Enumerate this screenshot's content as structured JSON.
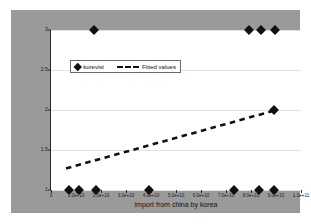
{
  "chart_data": {
    "type": "scatter",
    "title": "",
    "xlabel": "import from china by korea",
    "ylabel": "",
    "xlim": [
      0,
      100000000000
    ],
    "ylim": [
      1,
      3
    ],
    "grid": true,
    "legend_position": "upper-left-inside",
    "xticks": [
      0,
      10000000000,
      20000000000,
      30000000000,
      40000000000,
      50000000000,
      60000000000,
      70000000000,
      80000000000,
      90000000000,
      100000000000
    ],
    "xtick_labels": [
      "0",
      "1.0e+10",
      "2.0e+10",
      "3.0e+10",
      "4.0e+10",
      "5.0e+10",
      "6.0e+10",
      "7.0e+10",
      "8.0e+10",
      "9.0e+10",
      "1.0e+11"
    ],
    "yticks": [
      1,
      1.5,
      2,
      2.5,
      3
    ],
    "ytick_labels": [
      "1",
      "1.5",
      "2",
      "2.5",
      "3"
    ],
    "series": [
      {
        "name": "korevist",
        "type": "scatter",
        "marker": "diamond",
        "color": "#111111",
        "points": [
          {
            "x": 7000000000,
            "y": 1
          },
          {
            "x": 11000000000,
            "y": 1
          },
          {
            "x": 18000000000,
            "y": 1
          },
          {
            "x": 39000000000,
            "y": 1
          },
          {
            "x": 73000000000,
            "y": 1
          },
          {
            "x": 83000000000,
            "y": 1
          },
          {
            "x": 89000000000,
            "y": 1
          },
          {
            "x": 17000000000,
            "y": 3
          },
          {
            "x": 79000000000,
            "y": 3
          },
          {
            "x": 84000000000,
            "y": 3
          },
          {
            "x": 89500000000,
            "y": 3
          },
          {
            "x": 89000000000,
            "y": 2
          }
        ]
      },
      {
        "name": "Fitted values",
        "type": "line",
        "style": "dashed",
        "color": "#111111",
        "points": [
          {
            "x": 6000000000,
            "y": 1.27
          },
          {
            "x": 89000000000,
            "y": 1.99
          }
        ]
      }
    ]
  },
  "legend": {
    "entries": [
      {
        "label": "korevist",
        "icon": "diamond-marker"
      },
      {
        "label": "Fitted values",
        "icon": "dashed-line"
      }
    ]
  },
  "axis_title": {
    "x": "import from china by korea"
  },
  "colors": {
    "figure_background": "#ffffff",
    "graph_background": "#9a9a9a",
    "plot_background": "#ffffff",
    "marker": "#111111",
    "gridline": "#e2e2e2",
    "axis": "#2a2a2a"
  }
}
